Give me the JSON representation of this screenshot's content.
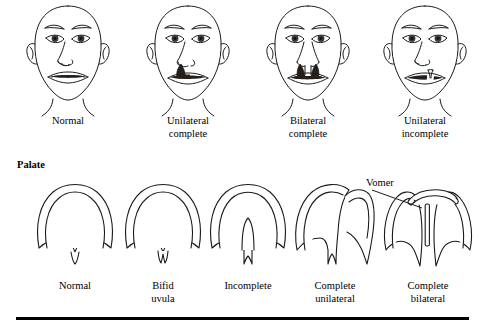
{
  "figure": {
    "line_color": "#1a1a1a",
    "fill_color": "#ffffff",
    "cleft_shade_color": "#241f1c",
    "background": "#ffffff"
  },
  "lip_section": {
    "heading": "",
    "items": [
      {
        "caption_line1": "Normal",
        "caption_line2": "",
        "cleft_type": "none"
      },
      {
        "caption_line1": "Unilateral",
        "caption_line2": "complete",
        "cleft_type": "unilateral-complete"
      },
      {
        "caption_line1": "Bilateral",
        "caption_line2": "complete",
        "cleft_type": "bilateral-complete"
      },
      {
        "caption_line1": "Unilateral",
        "caption_line2": "incomplete",
        "cleft_type": "unilateral-incomplete"
      }
    ]
  },
  "palate_section": {
    "heading": "Palate",
    "annotation": {
      "label": "Vomer"
    },
    "items": [
      {
        "caption_line1": "Normal",
        "caption_line2": "",
        "cleft_type": "none"
      },
      {
        "caption_line1": "Bifid",
        "caption_line2": "uvula",
        "cleft_type": "bifid-uvula"
      },
      {
        "caption_line1": "Incomplete",
        "caption_line2": "",
        "cleft_type": "incomplete"
      },
      {
        "caption_line1": "Complete",
        "caption_line2": "unilateral",
        "cleft_type": "complete-unilateral"
      },
      {
        "caption_line1": "Complete",
        "caption_line2": "bilateral",
        "cleft_type": "complete-bilateral"
      }
    ]
  }
}
